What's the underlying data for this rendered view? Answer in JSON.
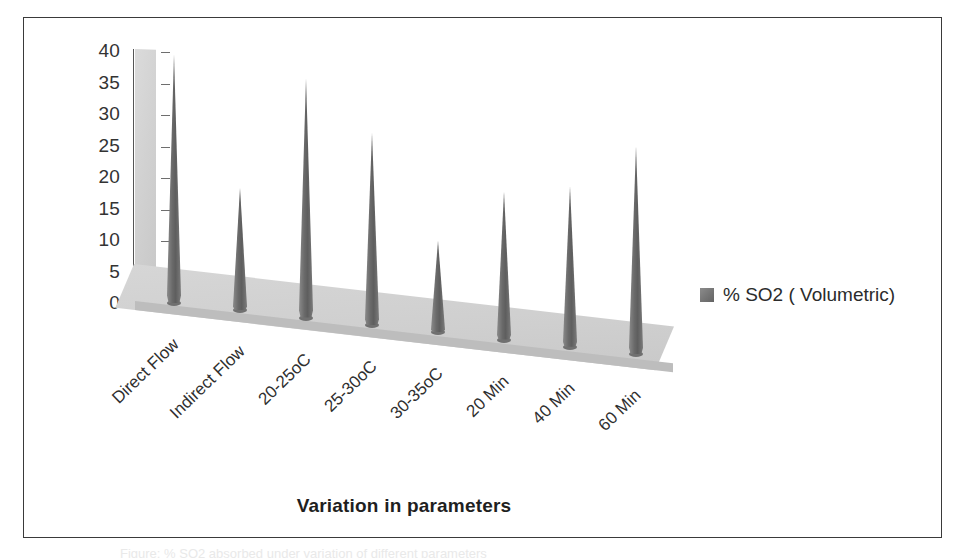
{
  "figure": {
    "caption_partial": "Figure: % SO2 absorbed under variation of different parameters"
  },
  "legend": {
    "position": "right",
    "swatch_color": "#6d6d6d",
    "label": "% SO2 ( Volumetric)"
  },
  "axis": {
    "x_title": "Variation in parameters",
    "y_ticks": [
      "40",
      "35",
      "30",
      "25",
      "20",
      "15",
      "10",
      "5",
      "0"
    ]
  },
  "chart_data": {
    "type": "bar",
    "title": "",
    "subtitle": "",
    "xlabel": "Variation in parameters",
    "ylabel": "",
    "ylim": [
      0,
      40
    ],
    "ytick_step": 5,
    "grid": false,
    "legend_position": "right",
    "style": "3d-cone",
    "categories": [
      "Direct Flow",
      "Indirect Flow",
      "20-25oC",
      "25-30oC",
      "30-35oC",
      "20 Min",
      "40 Min",
      "60 Min"
    ],
    "series": [
      {
        "name": "% SO2 ( Volumetric)",
        "color": "#6d6d6d",
        "values": [
          39.5,
          19.5,
          38,
          30.5,
          14.5,
          23.5,
          25.5,
          33
        ]
      }
    ]
  }
}
